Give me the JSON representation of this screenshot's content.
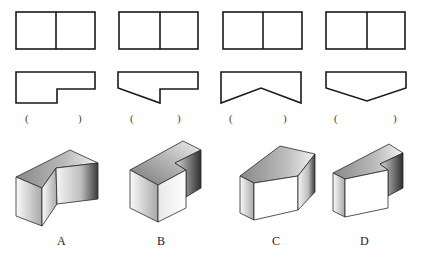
{
  "views": [
    {
      "id": "view-1",
      "answer_blank": {
        "open": "(",
        "close": ")"
      }
    },
    {
      "id": "view-2",
      "answer_blank": {
        "open": "(",
        "close": ")"
      }
    },
    {
      "id": "view-3",
      "answer_blank": {
        "open": "(",
        "close": ")"
      }
    },
    {
      "id": "view-4",
      "answer_blank": {
        "open": "(",
        "close": ")"
      }
    }
  ],
  "solids": [
    {
      "label": "A"
    },
    {
      "label": "B"
    },
    {
      "label": "C"
    },
    {
      "label": "D"
    }
  ],
  "colors": {
    "line": "#1a1a1a",
    "face_light": "#ffffff",
    "face_dark": "#333333"
  }
}
